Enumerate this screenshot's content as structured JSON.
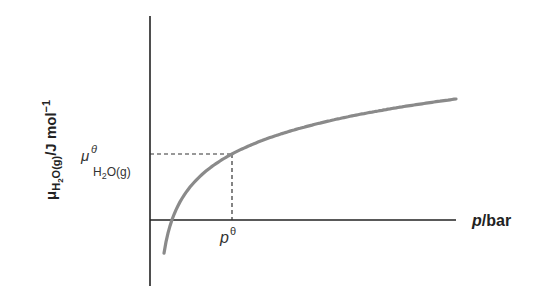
{
  "chart_data": {
    "type": "line",
    "title": "",
    "xlabel": {
      "var": "p",
      "unit": "/bar"
    },
    "ylabel": {
      "var": "μ",
      "sub": "H2O(g)",
      "unit": "/J mol",
      "sup": "−1"
    },
    "series": [
      {
        "name": "chemical potential vs pressure",
        "form": "logarithmic",
        "description": "μ = μθ + RT ln(p/pθ)"
      }
    ],
    "annotations": {
      "y_marker": {
        "symbol": "μ",
        "sup": "θ",
        "sub": "H2O(g)"
      },
      "x_marker": {
        "symbol": "p",
        "sup": "θ"
      }
    },
    "grid": false,
    "ticks": "none"
  },
  "labels": {
    "y_mu": "μ",
    "y_sub_H": "H",
    "y_sub_2": "2",
    "y_sub_rest": "O(g)",
    "y_unit": "/J mol",
    "y_sup": "−1",
    "x_p": "p",
    "x_unit": "/bar",
    "mu_theta_symbol": "μ",
    "mu_theta_sup": "θ",
    "mu_theta_sub_H": "H",
    "mu_theta_sub_2": "2",
    "mu_theta_sub_rest": "O(g)",
    "p_theta_symbol": "p",
    "p_theta_sup": "θ"
  }
}
